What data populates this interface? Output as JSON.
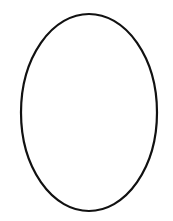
{
  "canvas": {
    "width": 173,
    "height": 221,
    "background": "#ffffff"
  },
  "shape": {
    "type": "ellipse",
    "cx": 89,
    "cy": 112.5,
    "rx": 68,
    "ry": 98.5,
    "stroke": "#111111",
    "stroke_width": 2.2,
    "fill": "none"
  }
}
